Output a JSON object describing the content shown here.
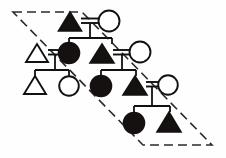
{
  "diagram": {
    "type": "kinship-chart",
    "canvas": {
      "width": 226,
      "height": 158
    },
    "colors": {
      "background": "#fefefe",
      "stroke": "#111111",
      "filled": "#141110",
      "open": "#ffffff",
      "boundary": "#2a2a2a"
    },
    "legend_semantics": {
      "triangle": "male",
      "circle": "female",
      "filled": "member of highlighted descent group",
      "open": "non-member / married-in",
      "double_bar": "marriage tie",
      "dashed_parallelogram": "descent group boundary"
    },
    "boundary": {
      "name": "descent-group-boundary",
      "shape": "parallelogram",
      "points": "13,12 82,12 212,145 143,145",
      "dasharray": "9 5"
    },
    "generations": [
      {
        "level": 1,
        "y": 22,
        "persons": [
          {
            "id": "g1-m1",
            "shape": "triangle",
            "fill": "filled",
            "sex": "male",
            "cx": 70,
            "cy": 22,
            "size": 22
          },
          {
            "id": "g1-f1",
            "shape": "circle",
            "fill": "open",
            "sex": "female",
            "cx": 108,
            "cy": 22,
            "size": 20
          }
        ]
      },
      {
        "level": 2,
        "y": 54,
        "persons": [
          {
            "id": "g2-m0",
            "shape": "triangle",
            "fill": "open",
            "sex": "male",
            "cx": 38,
            "cy": 54,
            "size": 22
          },
          {
            "id": "g2-f1",
            "shape": "circle",
            "fill": "filled",
            "sex": "female",
            "cx": 69,
            "cy": 53,
            "size": 20
          },
          {
            "id": "g2-m1",
            "shape": "triangle",
            "fill": "filled",
            "sex": "male",
            "cx": 102,
            "cy": 54,
            "size": 23
          },
          {
            "id": "g2-f2",
            "shape": "circle",
            "fill": "open",
            "sex": "female",
            "cx": 140,
            "cy": 53,
            "size": 20
          }
        ]
      },
      {
        "level": 3,
        "y": 86,
        "persons": [
          {
            "id": "g3-m0",
            "shape": "triangle",
            "fill": "open",
            "sex": "male",
            "cx": 35,
            "cy": 86,
            "size": 22
          },
          {
            "id": "g3-f0",
            "shape": "circle",
            "fill": "open",
            "sex": "female",
            "cx": 68,
            "cy": 85,
            "size": 19
          },
          {
            "id": "g3-f1",
            "shape": "circle",
            "fill": "filled",
            "sex": "female",
            "cx": 102,
            "cy": 85,
            "size": 21
          },
          {
            "id": "g3-m1",
            "shape": "triangle",
            "fill": "filled",
            "sex": "male",
            "cx": 134,
            "cy": 86,
            "size": 23
          },
          {
            "id": "g3-f2",
            "shape": "circle",
            "fill": "open",
            "sex": "female",
            "cx": 167,
            "cy": 85,
            "size": 19
          }
        ]
      },
      {
        "level": 4,
        "y": 124,
        "persons": [
          {
            "id": "g4-f1",
            "shape": "circle",
            "fill": "filled",
            "sex": "female",
            "cx": 134,
            "cy": 123,
            "size": 21
          },
          {
            "id": "g4-m1",
            "shape": "triangle",
            "fill": "filled",
            "sex": "male",
            "cx": 168,
            "cy": 124,
            "size": 23
          }
        ]
      }
    ],
    "marriages": [
      {
        "id": "marriage-1",
        "x1": 81,
        "x2": 98,
        "y": 20,
        "drop_x": 89,
        "drop_y": 38
      },
      {
        "id": "marriage-2",
        "x1": 49,
        "x2": 59,
        "y": 52,
        "drop_x": 54,
        "drop_y": 70
      },
      {
        "id": "marriage-3",
        "x1": 114,
        "x2": 130,
        "y": 52,
        "drop_x": 122,
        "drop_y": 70
      },
      {
        "id": "marriage-4",
        "x1": 146,
        "x2": 157,
        "y": 84,
        "drop_x": 151,
        "drop_y": 106
      }
    ],
    "sibling_sets": [
      {
        "id": "sibship-1",
        "bar_y": 38,
        "from_x": 69,
        "to_x": 102,
        "children_x": [
          69,
          102
        ],
        "child_y": 42
      },
      {
        "id": "sibship-2",
        "bar_y": 70,
        "from_x": 35,
        "to_x": 68,
        "children_x": [
          35,
          68
        ],
        "child_y": 76
      },
      {
        "id": "sibship-3",
        "bar_y": 70,
        "from_x": 102,
        "to_x": 134,
        "children_x": [
          102,
          134
        ],
        "child_y": 76
      },
      {
        "id": "sibship-4",
        "bar_y": 106,
        "from_x": 134,
        "to_x": 168,
        "children_x": [
          134,
          168
        ],
        "child_y": 112
      }
    ]
  }
}
